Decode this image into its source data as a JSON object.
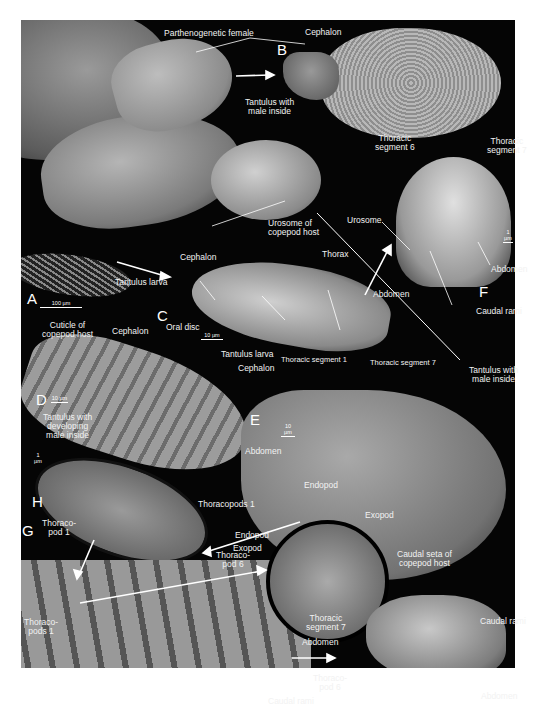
{
  "figure": {
    "panels": [
      {
        "letter": "A",
        "scale": "100 µm"
      },
      {
        "letter": "B"
      },
      {
        "letter": "C",
        "scale": "10 µm"
      },
      {
        "letter": "D",
        "scale": "10 µm"
      },
      {
        "letter": "E",
        "scale": "10 µm"
      },
      {
        "letter": "F",
        "scale": "1 µm"
      },
      {
        "letter": "G",
        "scale": "10 µm"
      },
      {
        "letter": "H",
        "scale": "1 µm"
      },
      {
        "letter": "I"
      },
      {
        "letter": "J",
        "scale": "1 µm"
      }
    ],
    "labels": {
      "parthenogenetic_female": "Parthenogenetic female",
      "cephalon_b": "Cephalon",
      "tantulus_male_inside_a": [
        "Tantulus with",
        "male inside"
      ],
      "urosome_host": [
        "Urosome of",
        "copepod host"
      ],
      "tantulus_larva_a": "Tantulus larva",
      "thoracic_seg6_f": [
        "Thoracic",
        "segment 6"
      ],
      "thoracic_seg7_f": [
        "Thoracic",
        "segment 7"
      ],
      "urosome_f": "Urosome",
      "abdomen_f": "Abdomen",
      "caudal_rami_f": "Caudal rami",
      "cephalon_c": "Cephalon",
      "thorax_c": "Thorax",
      "abdomen_c": "Abdomen",
      "oral_disc": "Oral disc",
      "tantulus_larva_c": "Tantulus larva",
      "thoracic_seg1_c": "Thoracic segment 1",
      "thoracic_seg7_c": "Thoracic segment 7",
      "cuticle_host": [
        "Cuticle of",
        "copepod host"
      ],
      "cephalon_d": "Cephalon",
      "tantulus_developing": [
        "Tantulus with",
        "developing",
        "male inside"
      ],
      "abdomen_d": "Abdomen",
      "cephalon_e": "Cephalon",
      "tantulus_male_inside_e": [
        "Tantulus with",
        "male inside"
      ],
      "thoracopods1_i": "Thoracopods 1",
      "endopod_top": "Endopod",
      "endopod_mid": "Endopod",
      "exopod_right": "Exopod",
      "exopod_left": "Exopod",
      "thoracopod6_g": [
        "Thoraco-",
        "pod 6"
      ],
      "thoracopod1_h": [
        "Thoraco-",
        "pod 1"
      ],
      "thoracopods1_g": [
        "Thoraco-",
        "pods 1"
      ],
      "caudal_seta_host": [
        "Caudal seta of",
        "copepod host"
      ],
      "thoracic_seg7_j": [
        "Thoracic",
        "segment 7"
      ],
      "abdomen_g": "Abdomen",
      "caudal_rami_g": "Caudal rami",
      "caudal_rami_j": "Caudal rami",
      "thoracopod6_j": [
        "Thoraco-",
        "pod 6"
      ],
      "abdomen_j": "Abdomen"
    }
  }
}
